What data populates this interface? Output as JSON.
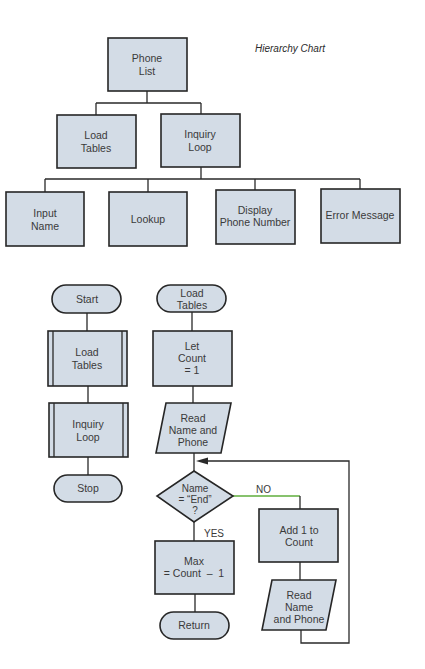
{
  "hierarchy_chart": {
    "title": "Hierarchy Chart",
    "root": {
      "line1": "Phone",
      "line2": "List"
    },
    "level1": [
      {
        "line1": "Load",
        "line2": "Tables"
      },
      {
        "line1": "Inquiry",
        "line2": "Loop"
      }
    ],
    "level2": [
      {
        "line1": "Input",
        "line2": "Name"
      },
      {
        "line1": "Lookup"
      },
      {
        "line1": "Display",
        "line2": "Phone Number"
      },
      {
        "line1": "Error Message"
      }
    ]
  },
  "main_flowchart": {
    "start": "Start",
    "load_tables": {
      "line1": "Load",
      "line2": "Tables"
    },
    "inquiry_loop": {
      "line1": "Inquiry",
      "line2": "Loop"
    },
    "stop": "Stop"
  },
  "load_tables_flowchart": {
    "entry": {
      "line1": "Load",
      "line2": "Tables"
    },
    "init": {
      "line1": "Let",
      "line2": "Count",
      "line3": "= 1"
    },
    "read1": {
      "line1": "Read",
      "line2": "Name and",
      "line3": "Phone"
    },
    "decision": {
      "line1": "Name",
      "line2": "= “End”",
      "line3": "?"
    },
    "no_label": "NO",
    "yes_label": "YES",
    "increment": {
      "line1": "Add 1 to",
      "line2": "Count"
    },
    "read2": {
      "line1": "Read",
      "line2": "Name",
      "line3": "and Phone"
    },
    "max": {
      "line1": "Max",
      "line2": "= Count  –  1"
    },
    "return": "Return"
  },
  "colors": {
    "box_fill": "#d3dce6",
    "stroke": "#262626",
    "text": "#3a3a3a",
    "no_branch_line": "#5fae3c"
  }
}
